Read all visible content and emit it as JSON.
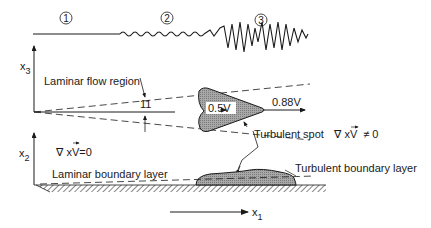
{
  "diagram": {
    "stages": [
      {
        "marker": "1",
        "label": "laminar"
      },
      {
        "marker": "2",
        "label": "transitional"
      },
      {
        "marker": "3",
        "label": "turbulent"
      }
    ],
    "axes": {
      "x3": {
        "base": "x",
        "sub": "3"
      },
      "x2": {
        "base": "x",
        "sub": "2"
      },
      "x1": {
        "base": "x",
        "sub": "1"
      }
    },
    "labels": {
      "laminar_flow_region": "Laminar flow region",
      "angle": "11",
      "rear_speed": "0.5V",
      "front_speed": "0.88V",
      "turbulent_spot": "Turbulent spot",
      "curl_nonzero": "∇ xV",
      "curl_nonzero_suffix": "≠ 0",
      "curl_zero": "∇ xV",
      "curl_zero_suffix": "=0",
      "laminar_boundary_layer": "Laminar boundary layer",
      "turbulent_boundary_layer": "Turbulent boundary layer"
    },
    "colors": {
      "ink": "#1a1a1a",
      "spot_fill": "#9a9a9a",
      "background": "#ffffff"
    }
  }
}
